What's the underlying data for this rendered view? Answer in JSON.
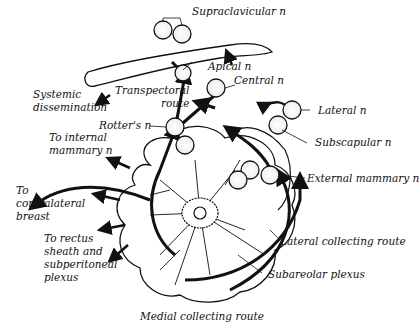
{
  "diagram": {
    "labels": {
      "supraclavicular": "Supraclavicular n",
      "apical": "Apical n",
      "central": "Central n",
      "lateral": "Lateral n",
      "subscapular": "Subscapular n",
      "external_mammary": "External mammary n",
      "systemic": "Systemic\ndissemination",
      "transpectoral": "Transpectoral\nroute",
      "rotters": "Rotter's n",
      "internal_mammary": "To internal\nmammary n",
      "contralateral": "To\ncontralateral\nbreast",
      "rectus": "To rectus\nsheath and\nsubperitoneal\nplexus",
      "lateral_collecting": "Lateral collecting route",
      "subareolar": "Subareolar plexus",
      "medial_collecting": "Medial collecting route"
    },
    "colors": {
      "ink": "#111111",
      "background": "#ffffff"
    }
  }
}
